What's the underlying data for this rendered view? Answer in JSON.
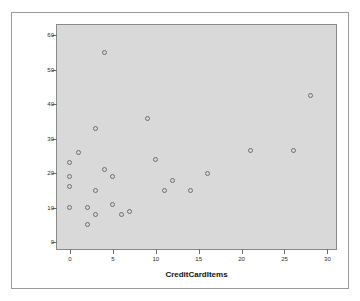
{
  "figure": {
    "background_color": "#ffffff",
    "plot_background_color": "#d9d9d9",
    "frame_color": "#8a8a8a",
    "marker_color": "#6e6e6e"
  },
  "chart_data": {
    "type": "scatter",
    "title": "",
    "xlabel": "CreditCardItems",
    "ylabel": "CashItems",
    "xlim": [
      -1.5,
      31
    ],
    "ylim": [
      -2,
      63
    ],
    "grid": false,
    "legend": null,
    "xticks": [
      0,
      5,
      10,
      15,
      20,
      25,
      30
    ],
    "xtick_labels": [
      "0",
      "5",
      "10",
      "15",
      "20",
      "25",
      "30"
    ],
    "yticks": [
      0,
      10,
      20,
      30,
      40,
      50,
      60
    ],
    "ytick_labels": [
      "0",
      "10",
      "20",
      "30",
      "40",
      "50",
      "60"
    ],
    "series": [
      {
        "name": "points",
        "marker": "open-circle",
        "points": [
          {
            "x": 0,
            "y": 23
          },
          {
            "x": 0,
            "y": 19
          },
          {
            "x": 0,
            "y": 16
          },
          {
            "x": 0,
            "y": 10
          },
          {
            "x": 1,
            "y": 26
          },
          {
            "x": 2,
            "y": 10
          },
          {
            "x": 2,
            "y": 5
          },
          {
            "x": 3,
            "y": 33
          },
          {
            "x": 3,
            "y": 15
          },
          {
            "x": 3,
            "y": 8
          },
          {
            "x": 4,
            "y": 55
          },
          {
            "x": 4,
            "y": 21
          },
          {
            "x": 5,
            "y": 19
          },
          {
            "x": 5,
            "y": 11
          },
          {
            "x": 6,
            "y": 8
          },
          {
            "x": 7,
            "y": 9
          },
          {
            "x": 9,
            "y": 36
          },
          {
            "x": 10,
            "y": 24
          },
          {
            "x": 11,
            "y": 15
          },
          {
            "x": 12,
            "y": 18
          },
          {
            "x": 14,
            "y": 15
          },
          {
            "x": 16,
            "y": 20
          },
          {
            "x": 21,
            "y": 26.5
          },
          {
            "x": 26,
            "y": 26.5
          },
          {
            "x": 28,
            "y": 42.5
          }
        ]
      }
    ]
  }
}
